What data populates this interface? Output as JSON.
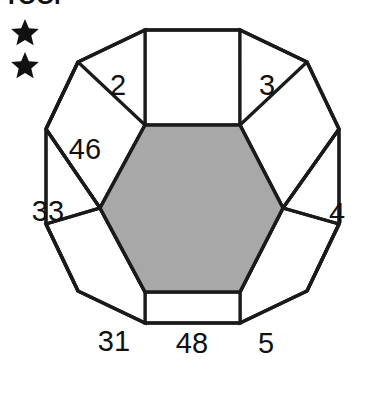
{
  "heading": {
    "clipped_text": "TOOl"
  },
  "markers": {
    "star_icon_name": "star-icon",
    "count": 2,
    "items": [
      {
        "label": "★"
      },
      {
        "label": "★"
      }
    ]
  },
  "figure": {
    "name": "dodecagon-hexagon-diagram",
    "outline_color": "#1a1a1a",
    "fill_color": "#ffffff",
    "center_fill_color": "#a8a8a8",
    "center_shape": "hexagon",
    "outer_shape": "dodecagon",
    "square_count": 6,
    "triangle_count": 6,
    "cells": [
      {
        "id": "square-top",
        "shape": "square",
        "label": ""
      },
      {
        "id": "triangle-upper-left",
        "shape": "triangle",
        "label": "2"
      },
      {
        "id": "triangle-upper-right",
        "shape": "triangle",
        "label": "3"
      },
      {
        "id": "square-upper-left",
        "shape": "square",
        "label": "46"
      },
      {
        "id": "square-upper-right",
        "shape": "square",
        "label": ""
      },
      {
        "id": "triangle-left",
        "shape": "triangle",
        "label": "33"
      },
      {
        "id": "triangle-right",
        "shape": "triangle",
        "label": "4"
      },
      {
        "id": "square-lower-left",
        "shape": "square",
        "label": ""
      },
      {
        "id": "square-lower-right",
        "shape": "square",
        "label": ""
      },
      {
        "id": "triangle-lower-left",
        "shape": "triangle",
        "label": "31"
      },
      {
        "id": "square-bottom",
        "shape": "square",
        "label": "48"
      },
      {
        "id": "triangle-lower-right",
        "shape": "triangle",
        "label": "5"
      },
      {
        "id": "hexagon-center",
        "shape": "hexagon",
        "label": ""
      }
    ]
  }
}
